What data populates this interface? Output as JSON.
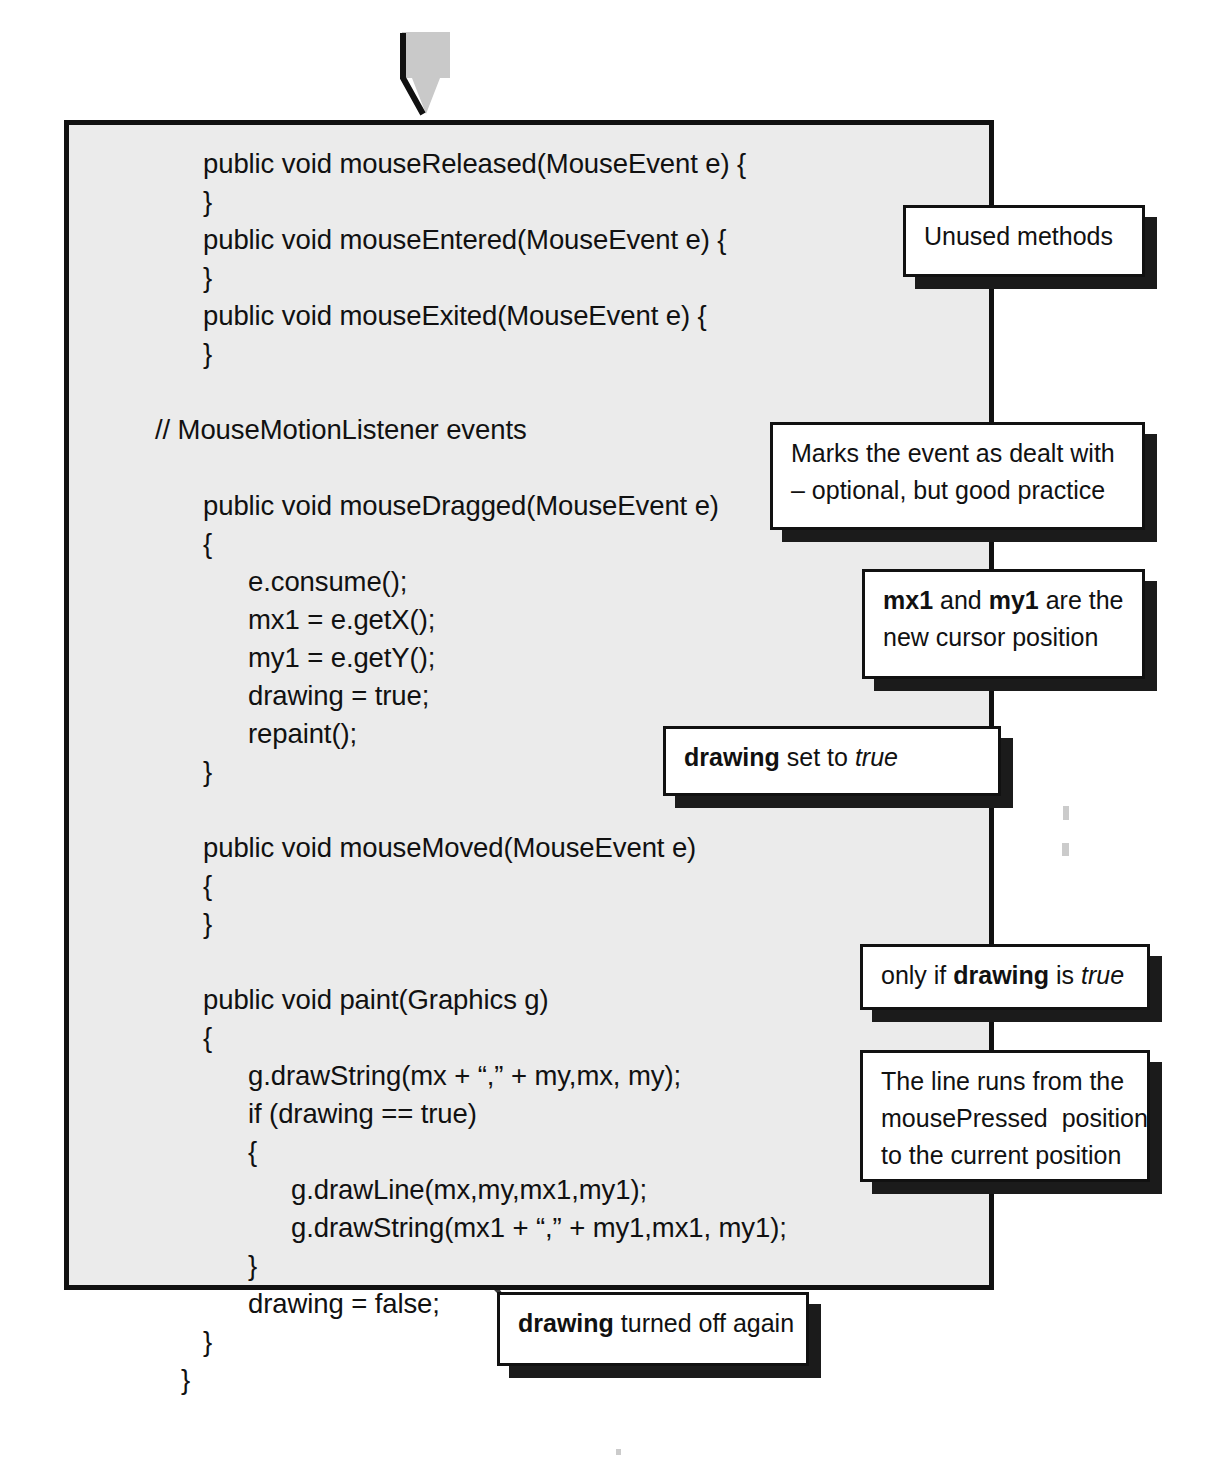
{
  "diagram": {
    "arrow": {
      "name": "down-arrow",
      "color": "#c9c9c9"
    },
    "panel": {
      "background": "#ebebeb",
      "border_color": "#111111"
    }
  },
  "code": {
    "lines": [
      {
        "text": "public void mouseReleased(MouseEvent e) {",
        "indent": 1
      },
      {
        "text": "}",
        "indent": 1
      },
      {
        "text": "public void mouseEntered(MouseEvent e) {",
        "indent": 1
      },
      {
        "text": "}",
        "indent": 1
      },
      {
        "text": "public void mouseExited(MouseEvent e) {",
        "indent": 1
      },
      {
        "text": "}",
        "indent": 1
      },
      {
        "text": "",
        "indent": 0
      },
      {
        "text": "// MouseMotionListener events",
        "indent": 0
      },
      {
        "text": "",
        "indent": 0
      },
      {
        "text": "public void mouseDragged(MouseEvent e)",
        "indent": 1
      },
      {
        "text": "{",
        "indent": 1
      },
      {
        "text": "e.consume();",
        "indent": 2
      },
      {
        "text": "mx1 = e.getX();",
        "indent": 2
      },
      {
        "text": "my1 = e.getY();",
        "indent": 2
      },
      {
        "text": "drawing = true;",
        "indent": 2
      },
      {
        "text": "repaint();",
        "indent": 2
      },
      {
        "text": "}",
        "indent": 1
      },
      {
        "text": "",
        "indent": 0
      },
      {
        "text": "public void mouseMoved(MouseEvent e)",
        "indent": 1
      },
      {
        "text": "{",
        "indent": 1
      },
      {
        "text": "}",
        "indent": 1
      },
      {
        "text": "",
        "indent": 0
      },
      {
        "text": "public void paint(Graphics g)",
        "indent": 1
      },
      {
        "text": "{",
        "indent": 1
      },
      {
        "text": "g.drawString(mx + “,” + my,mx, my);",
        "indent": 2
      },
      {
        "text": "if (drawing == true)",
        "indent": 2
      },
      {
        "text": "{",
        "indent": 2
      },
      {
        "text": "g.drawLine(mx,my,mx1,my1);",
        "indent": 3
      },
      {
        "text": "g.drawString(mx1 + “,” + my1,mx1, my1);",
        "indent": 3
      },
      {
        "text": "}",
        "indent": 2
      },
      {
        "text": "drawing = false;",
        "indent": 2
      },
      {
        "text": "}",
        "indent": 1
      },
      {
        "text": "}",
        "indent": 0.6
      }
    ]
  },
  "callouts": [
    {
      "id": "unused-methods",
      "lines": [
        [
          {
            "t": "Unused methods",
            "s": "n"
          }
        ]
      ]
    },
    {
      "id": "marks-event",
      "lines": [
        [
          {
            "t": "Marks the event as dealt with",
            "s": "n"
          }
        ],
        [
          {
            "t": "– optional, but good practice",
            "s": "n"
          }
        ]
      ]
    },
    {
      "id": "mx1-my1",
      "lines": [
        [
          {
            "t": "mx1",
            "s": "b"
          },
          {
            "t": " and ",
            "s": "n"
          },
          {
            "t": "my1",
            "s": "b"
          },
          {
            "t": " are the",
            "s": "n"
          }
        ],
        [
          {
            "t": "new cursor position",
            "s": "n"
          }
        ]
      ]
    },
    {
      "id": "drawing-set-true",
      "lines": [
        [
          {
            "t": "drawing",
            "s": "b"
          },
          {
            "t": " set to ",
            "s": "n"
          },
          {
            "t": "true",
            "s": "i"
          }
        ]
      ]
    },
    {
      "id": "only-if-drawing",
      "lines": [
        [
          {
            "t": "only if ",
            "s": "n"
          },
          {
            "t": "drawing",
            "s": "b"
          },
          {
            "t": " is ",
            "s": "n"
          },
          {
            "t": "true",
            "s": "i"
          }
        ]
      ]
    },
    {
      "id": "line-runs-from",
      "lines": [
        [
          {
            "t": "The line runs from the",
            "s": "n"
          }
        ],
        [
          {
            "t": "mousePressed  position",
            "s": "n"
          }
        ],
        [
          {
            "t": "to the current position",
            "s": "n"
          }
        ]
      ]
    },
    {
      "id": "drawing-turned-off",
      "lines": [
        [
          {
            "t": "drawing",
            "s": "b"
          },
          {
            "t": " turned off again",
            "s": "n"
          }
        ]
      ]
    }
  ]
}
